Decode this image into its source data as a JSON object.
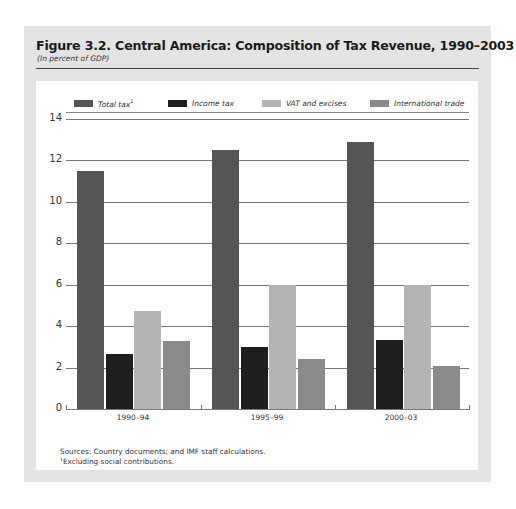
{
  "figure": {
    "title": "Figure 3.2.  Central America: Composition of Tax Revenue, 1990–2003",
    "subtitle": "(In percent of GDP)",
    "source_note": "Sources: Country documents; and IMF staff calculations.",
    "footnote_marker": "1",
    "footnote": "Excluding social contributions."
  },
  "legend": [
    {
      "label": "Total tax",
      "sup": "1",
      "color": "#555555"
    },
    {
      "label": "Income tax",
      "sup": "",
      "color": "#1e1e1e"
    },
    {
      "label": "VAT and excises",
      "sup": "",
      "color": "#b4b4b4"
    },
    {
      "label": "International trade",
      "sup": "",
      "color": "#8a8a8a"
    }
  ],
  "y_ticks": [
    "0",
    "2",
    "4",
    "6",
    "8",
    "10",
    "12",
    "14"
  ],
  "chart_data": {
    "type": "bar",
    "title": "Central America: Composition of Tax Revenue, 1990–2003",
    "subtitle": "(In percent of GDP)",
    "xlabel": "",
    "ylabel": "",
    "ylim": [
      0,
      14
    ],
    "y_ticks": [
      0,
      2,
      4,
      6,
      8,
      10,
      12,
      14
    ],
    "grid": true,
    "legend_position": "top",
    "categories": [
      "1990–94",
      "1995–99",
      "2000–03"
    ],
    "series": [
      {
        "name": "Total tax",
        "color": "#555555",
        "values": [
          11.5,
          12.5,
          12.9
        ]
      },
      {
        "name": "Income tax",
        "color": "#1e1e1e",
        "values": [
          2.65,
          3.0,
          3.35
        ]
      },
      {
        "name": "VAT and excises",
        "color": "#b4b4b4",
        "values": [
          4.75,
          6.0,
          6.0
        ]
      },
      {
        "name": "International trade",
        "color": "#8a8a8a",
        "values": [
          3.3,
          2.4,
          2.1
        ]
      }
    ],
    "notes": [
      "Sources: Country documents; and IMF staff calculations.",
      "1 Excluding social contributions."
    ]
  }
}
